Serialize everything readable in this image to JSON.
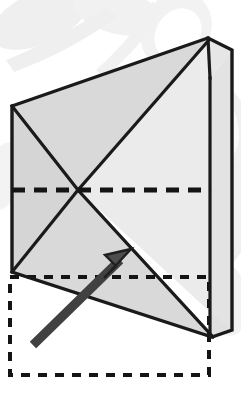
{
  "figure": {
    "canvas": {
      "width": 241,
      "height": 397,
      "background": "#ffffff"
    },
    "colors": {
      "outline": "#1a1a1a",
      "face_light": "#eeeeee",
      "face_mid": "#dcdcdc",
      "face_dark": "#cfcfcf",
      "fold_line": "#141414",
      "arrow": "#4d4d4d",
      "arrow_outline": "#1a1a1a",
      "watermark": "#ececec"
    },
    "shapes": {
      "paper_outline": {
        "label": "paper-outline",
        "points": "12,106 208,38 232,50 232,330 212,337 12,272"
      },
      "face_upper_left": {
        "label": "face-upper-left",
        "points": "12,106 208,38 78,190"
      },
      "face_left_wedge": {
        "label": "face-left-wedge",
        "points": "12,106 78,190 12,272"
      },
      "face_lower_left": {
        "label": "face-lower-left",
        "points": "12,272 78,190 212,337"
      },
      "face_right_upper": {
        "label": "face-right-upper",
        "points": "208,38 210,310 78,190"
      },
      "face_right_lower": {
        "label": "face-right-lower",
        "points": "210,310 212,337 232,330 232,50"
      },
      "flap_tip_top": {
        "label": "flap-tip-top",
        "points": "208,38 232,50 210,78"
      },
      "flap_tip_bottom": {
        "label": "flap-tip-bottom",
        "points": "210,310 232,330 212,337"
      }
    },
    "lines": {
      "diag_tl_to_center": {
        "label": "crease-top-left-to-center",
        "x1": 12,
        "y1": 106,
        "x2": 78,
        "y2": 190
      },
      "diag_center_to_apex": {
        "label": "crease-center-to-apex",
        "x1": 78,
        "y1": 190,
        "x2": 208,
        "y2": 40
      },
      "diag_bl_to_center": {
        "label": "crease-bottom-left-to-center",
        "x1": 12,
        "y1": 272,
        "x2": 78,
        "y2": 190
      },
      "diag_center_to_br": {
        "label": "crease-center-to-bottom-right",
        "x1": 78,
        "y1": 190,
        "x2": 213,
        "y2": 337
      },
      "right_vertical": {
        "label": "right-vertical-edge",
        "x1": 210,
        "y1": 78,
        "x2": 210,
        "y2": 337
      }
    },
    "dashed": {
      "horizontal_fold": {
        "label": "horizontal-fold-line",
        "x1": 12,
        "y1": 190,
        "x2": 211,
        "y2": 190,
        "dash": "13 9",
        "width": 5
      },
      "ghost_rectangle": {
        "label": "ghost-outline-rectangle",
        "x": 10,
        "y": 277,
        "width": 199,
        "height": 98,
        "dash": "9 8",
        "width_stroke": 4
      }
    },
    "arrow": {
      "label": "fold-direction-arrow",
      "tail_x": 33,
      "tail_y": 345,
      "tip_x": 131,
      "tip_y": 249,
      "shaft_width": 8,
      "head_length": 30,
      "head_width": 26
    },
    "watermark_blobs": [
      {
        "label": "watermark-blob-top-left",
        "cx": 40,
        "cy": 18,
        "rx": 52,
        "ry": 26,
        "rot": -24
      },
      {
        "label": "watermark-blob-top-mid",
        "cx": 118,
        "cy": 12,
        "rx": 46,
        "ry": 22,
        "rot": 14
      },
      {
        "label": "watermark-blob-top-right",
        "cx": 176,
        "cy": 30,
        "rx": 34,
        "ry": 40,
        "rot": 32
      },
      {
        "label": "watermark-blob-right-upper",
        "cx": 224,
        "cy": 128,
        "rx": 26,
        "ry": 44,
        "rot": -12
      },
      {
        "label": "watermark-blob-right-mid",
        "cx": 230,
        "cy": 215,
        "rx": 22,
        "ry": 52,
        "rot": 8
      },
      {
        "label": "watermark-blob-right-lower",
        "cx": 228,
        "cy": 300,
        "rx": 20,
        "ry": 36,
        "rot": -6
      },
      {
        "label": "watermark-blob-left-mid",
        "cx": 4,
        "cy": 176,
        "rx": 16,
        "ry": 34,
        "rot": 10
      }
    ]
  }
}
